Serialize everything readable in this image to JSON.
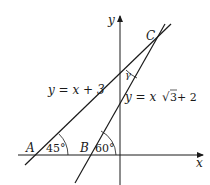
{
  "diagram": {
    "axes": {
      "x_label": "x",
      "y_label": "y"
    },
    "points": {
      "A": "A",
      "B": "B",
      "C": "C"
    },
    "lines": {
      "line1": {
        "equation": "y = x + 3",
        "angle_label": "45°"
      },
      "line2": {
        "equation_prefix": "y = x",
        "sqrt_arg": "3",
        "equation_suffix": " + 2",
        "angle_label": "60°"
      }
    },
    "angle_at_C": "γ",
    "colors": {
      "stroke": "#1a1a1a",
      "background": "#ffffff"
    }
  }
}
